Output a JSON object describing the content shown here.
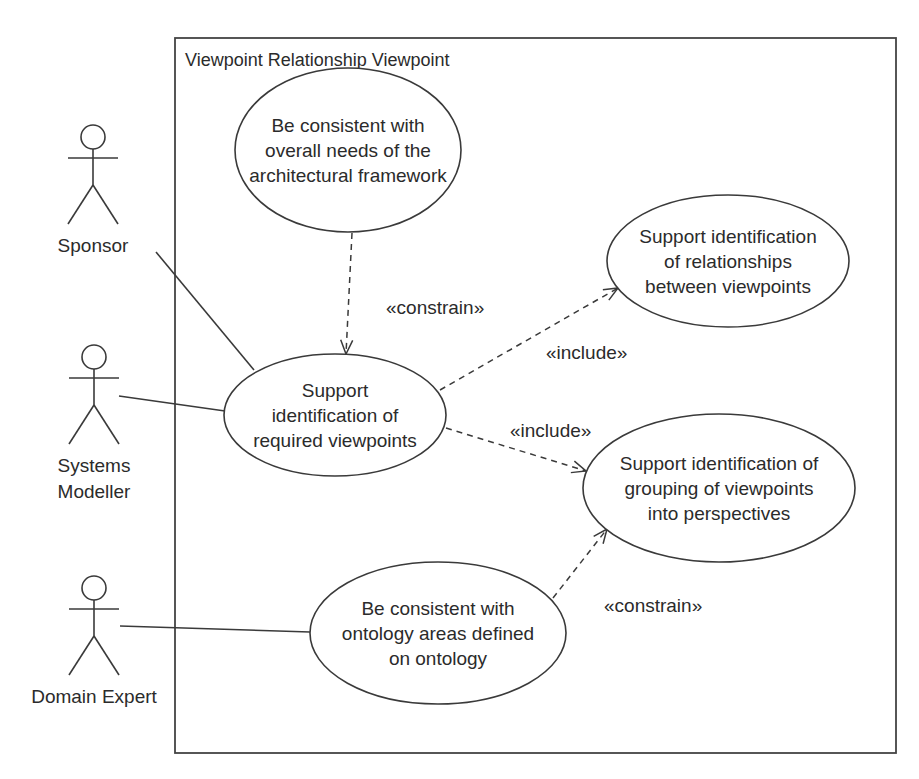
{
  "frame": {
    "title": "Viewpoint Relationship Viewpoint",
    "x": 175,
    "y": 38,
    "width": 721,
    "height": 715
  },
  "actors": [
    {
      "id": "sponsor",
      "label_lines": [
        "Sponsor"
      ],
      "cx": 93,
      "head_y": 137
    },
    {
      "id": "systems-modeller",
      "label_lines": [
        "Systems",
        "Modeller"
      ],
      "cx": 94,
      "head_y": 357
    },
    {
      "id": "domain-expert",
      "label_lines": [
        "Domain Expert"
      ],
      "cx": 94,
      "head_y": 588
    }
  ],
  "use_cases": [
    {
      "id": "uc-consistent-framework",
      "lines": [
        "Be consistent with",
        "overall needs of the",
        "architectural framework"
      ],
      "cx": 348,
      "cy": 150,
      "rx": 113,
      "ry": 82
    },
    {
      "id": "uc-required-viewpoints",
      "lines": [
        "Support",
        "identification of",
        "required viewpoints"
      ],
      "cx": 335,
      "cy": 415,
      "rx": 111,
      "ry": 61
    },
    {
      "id": "uc-relationships",
      "lines": [
        "Support identification",
        "of relationships",
        "between viewpoints"
      ],
      "cx": 728,
      "cy": 261,
      "rx": 121,
      "ry": 66
    },
    {
      "id": "uc-grouping",
      "lines": [
        "Support identification of",
        "grouping of viewpoints",
        "into perspectives"
      ],
      "cx": 719,
      "cy": 488,
      "rx": 136,
      "ry": 74
    },
    {
      "id": "uc-ontology-areas",
      "lines": [
        "Be consistent with",
        "ontology areas defined",
        "on ontology"
      ],
      "cx": 438,
      "cy": 633,
      "rx": 128,
      "ry": 71
    }
  ],
  "associations": [
    {
      "from": "sponsor",
      "to": "uc-required-viewpoints",
      "x1": 156,
      "y1": 252,
      "x2": 254,
      "y2": 370
    },
    {
      "from": "systems-modeller",
      "to": "uc-required-viewpoints",
      "x1": 119,
      "y1": 396,
      "x2": 225,
      "y2": 411
    },
    {
      "from": "domain-expert",
      "to": "uc-ontology-areas",
      "x1": 120,
      "y1": 626,
      "x2": 310,
      "y2": 632
    }
  ],
  "dependencies": [
    {
      "from": "uc-consistent-framework",
      "to": "uc-required-viewpoints",
      "stereotype": "«constrain»",
      "x1": 352,
      "y1": 233,
      "x2": 346,
      "y2": 354,
      "label_x": 386,
      "label_y": 314
    },
    {
      "from": "uc-required-viewpoints",
      "to": "uc-relationships",
      "stereotype": "«include»",
      "x1": 440,
      "y1": 390,
      "x2": 618,
      "y2": 288,
      "label_x": 546,
      "label_y": 359
    },
    {
      "from": "uc-required-viewpoints",
      "to": "uc-grouping",
      "stereotype": "«include»",
      "x1": 446,
      "y1": 428,
      "x2": 586,
      "y2": 471,
      "label_x": 510,
      "label_y": 437
    },
    {
      "from": "uc-ontology-areas",
      "to": "uc-grouping",
      "stereotype": "«constrain»",
      "x1": 553,
      "y1": 598,
      "x2": 607,
      "y2": 529,
      "label_x": 604,
      "label_y": 612
    }
  ]
}
